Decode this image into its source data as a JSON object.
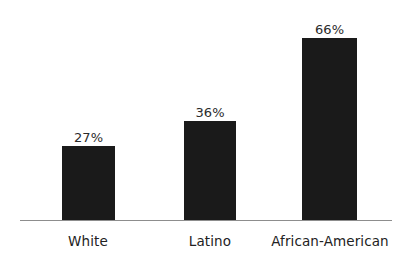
{
  "chart_data": {
    "type": "bar",
    "title": "",
    "subtitle": "",
    "xlabel": "",
    "ylabel": "",
    "categories": [
      "White",
      "Latino",
      "African-American"
    ],
    "values": [
      27,
      36,
      66
    ],
    "value_labels": [
      "27%",
      "36%",
      "66%"
    ],
    "unit": "%",
    "ylim": [
      0,
      80
    ],
    "grid": false,
    "legend": false,
    "legend_position": "none",
    "axis": {
      "x_axis_visible": true,
      "y_axis_visible": false,
      "x_tick_labels": [
        "White",
        "Latino",
        "African-American"
      ],
      "y_tick_labels": []
    },
    "series": [
      {
        "name": "",
        "values": [
          27,
          36,
          66
        ]
      }
    ],
    "colors": {
      "bar": "#1a1a1a",
      "background": "#ffffff",
      "axis_line": "#8d8d8d",
      "value_label_text": "#2b2b2b",
      "category_label_text": "#222222"
    }
  },
  "bars": [
    {
      "category": "White",
      "value": 27,
      "label": "27%"
    },
    {
      "category": "Latino",
      "value": 36,
      "label": "36%"
    },
    {
      "category": "African-American",
      "value": 66,
      "label": "66%"
    }
  ]
}
